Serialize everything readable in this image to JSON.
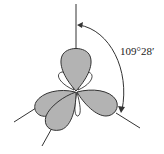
{
  "diagram": {
    "angle_label": "109°28′",
    "colors": {
      "lobe_fill": "#b3b3b3",
      "small_lobe_fill": "#ffffff",
      "stroke": "#333333",
      "background": "#ffffff"
    },
    "lobes": [
      {
        "name": "top-lobe",
        "direction": "up"
      },
      {
        "name": "right-lobe",
        "direction": "lower-right"
      },
      {
        "name": "left-lobe",
        "direction": "lower-left"
      },
      {
        "name": "front-lobe",
        "direction": "down-front"
      }
    ]
  }
}
